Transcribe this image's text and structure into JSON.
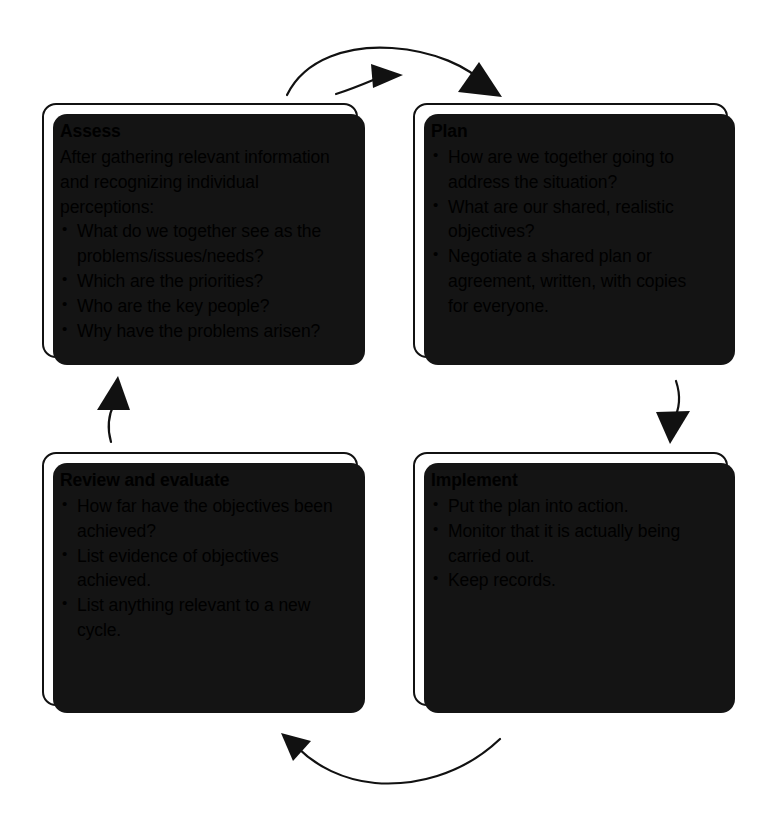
{
  "diagram": {
    "type": "cycle-flowchart",
    "colors": {
      "box_fill": "#ffffff",
      "box_border": "#111111",
      "box_shadow": "#141414",
      "arrow": "#111111",
      "text": "#000000"
    },
    "nodes": [
      {
        "id": "assess",
        "title": "Assess",
        "intro": "After gathering relevant information and recognizing individual perceptions:",
        "bullets": [
          "What do we together see as the problems/issues/needs?",
          "Which are the priorities?",
          "Who are the key people?",
          "Why have the problems arisen?"
        ]
      },
      {
        "id": "plan",
        "title": "Plan",
        "intro": "",
        "bullets": [
          "How are we together going to address the situation?",
          "What are our shared, realistic objectives?",
          "Negotiate a shared plan or agreement, written, with copies for everyone."
        ]
      },
      {
        "id": "implement",
        "title": "Implement",
        "intro": "",
        "bullets": [
          "Put the plan into action.",
          "Monitor that it is actually being carried out.",
          "Keep records."
        ]
      },
      {
        "id": "review",
        "title": "Review and evaluate",
        "intro": "",
        "bullets": [
          "How far have the objectives been achieved?",
          "List evidence of objectives achieved.",
          "List anything relevant to a new cycle."
        ]
      }
    ],
    "arrows": [
      {
        "id": "assess-to-plan",
        "from": "assess",
        "to": "plan",
        "shape": "long-arc-over-top"
      },
      {
        "id": "assess-to-plan-short",
        "from": "assess",
        "to": "plan",
        "shape": "short-straight-top"
      },
      {
        "id": "plan-to-implement",
        "from": "plan",
        "to": "implement",
        "shape": "short-curve-down-right"
      },
      {
        "id": "implement-to-review",
        "from": "implement",
        "to": "review",
        "shape": "long-arc-under-bottom"
      },
      {
        "id": "review-to-assess",
        "from": "review",
        "to": "assess",
        "shape": "short-curve-up-left"
      }
    ]
  }
}
